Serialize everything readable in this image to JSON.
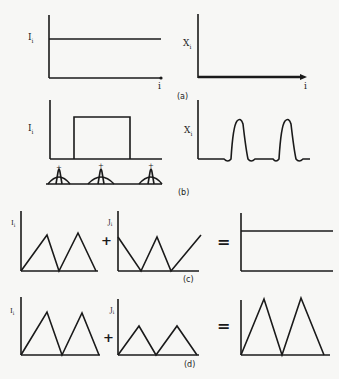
{
  "figure": {
    "panels": {
      "a": {
        "caption": "(a)",
        "left": {
          "ylabel": "I",
          "ylabel_sub": "i",
          "xlabel": "i",
          "curve": "constant"
        },
        "right": {
          "ylabel": "X",
          "ylabel_sub": "i",
          "xlabel": "i",
          "curve": "zero"
        }
      },
      "b": {
        "caption": "(b)",
        "left": {
          "ylabel": "I",
          "ylabel_sub": "i",
          "curve": "rectangular pulse"
        },
        "right": {
          "ylabel": "X",
          "ylabel_sub": "i",
          "curve": "two edge peaks"
        },
        "receptive_fields": [
          "+",
          "+",
          "+"
        ]
      },
      "c": {
        "caption": "(c)",
        "operand1": {
          "ylabel": "I",
          "ylabel_sub": "i",
          "curve": "triangles"
        },
        "plus": "+",
        "operand2": {
          "ylabel": "J",
          "ylabel_sub": "i",
          "curve": "inverted triangles"
        },
        "equals": "=",
        "result": {
          "curve": "constant"
        }
      },
      "d": {
        "caption": "(d)",
        "operand1": {
          "ylabel": "I",
          "ylabel_sub": "i",
          "curve": "triangles"
        },
        "plus": "+",
        "operand2": {
          "ylabel": "J",
          "ylabel_sub": "i",
          "curve": "smaller triangles"
        },
        "equals": "=",
        "result": {
          "curve": "larger triangles"
        }
      }
    },
    "colors": {
      "ink": "#1a1a1a",
      "paper": "#f7f7f5"
    }
  }
}
